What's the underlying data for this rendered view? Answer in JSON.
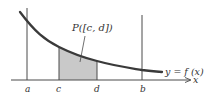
{
  "figure": {
    "colors": {
      "background": "#ffffff",
      "axis": "#4a4a4a",
      "curve": "#3a3a3a",
      "shade": "#c9c9c9",
      "text": "#333333"
    },
    "region_label": "P([c, d])",
    "curve_label": "y = f (x)",
    "axis_label": "x",
    "tick_labels": {
      "a": "a",
      "c": "c",
      "d": "d",
      "b": "b"
    }
  }
}
